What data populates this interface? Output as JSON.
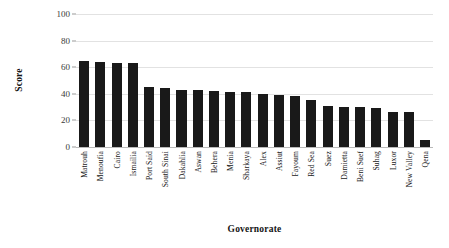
{
  "chart_data": {
    "type": "bar",
    "title": "",
    "xlabel": "Governorate",
    "ylabel": "Score",
    "ylim": [
      0,
      100
    ],
    "yticks": [
      0,
      20,
      40,
      60,
      80,
      100
    ],
    "grid": true,
    "legend": "none",
    "bar_color": "#191919",
    "categories": [
      "Matrouh",
      "Menoufia",
      "Cairo",
      "Ismailia",
      "Port Said",
      "South Sinai",
      "Dakahlia",
      "Aswan",
      "Behera",
      "Menia",
      "Sharkaya",
      "Alex",
      "Assiut",
      "Fayoum",
      "Red Sea",
      "Suez",
      "Damietta",
      "Beni Suef",
      "Suhag",
      "Luxor",
      "New Valley",
      "Qena"
    ],
    "values": [
      65,
      64,
      63,
      63,
      45,
      44,
      43,
      43,
      42,
      41,
      41,
      40,
      39,
      38,
      35,
      31,
      30,
      30,
      29,
      26,
      26,
      5
    ],
    "series": [
      {
        "name": "Score",
        "values": [
          65,
          64,
          63,
          63,
          45,
          44,
          43,
          43,
          42,
          41,
          41,
          40,
          39,
          38,
          35,
          31,
          30,
          30,
          29,
          26,
          26,
          5
        ]
      }
    ]
  }
}
